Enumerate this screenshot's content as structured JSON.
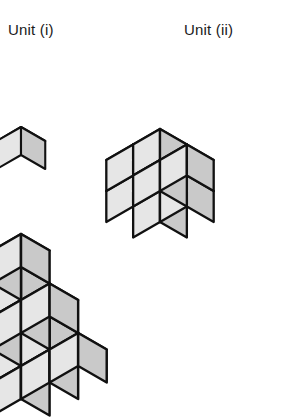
{
  "figure": {
    "title_unit_i": "Unit (i)",
    "title_unit_ii": "Unit (ii)"
  },
  "colors": {
    "top_face": "#ededed",
    "left_face": "#e6e6e6",
    "right_face": "#c9c9c9",
    "outline": "#111111",
    "background": "#ffffff",
    "text": "#1a1a1a"
  },
  "geometry": {
    "unit_i": {
      "cubes": 1,
      "cube_size_px": 28,
      "origin_x": 21,
      "origin_y": 155,
      "cells": [
        [
          0,
          0,
          0
        ]
      ]
    },
    "unit_ii": {
      "cubes": 8,
      "cube_size_px": 31,
      "origin_x": 160,
      "origin_y": 191,
      "dimensions": "2 x 2 x 2",
      "cells": [
        [
          0,
          0,
          0
        ],
        [
          1,
          0,
          0
        ],
        [
          0,
          1,
          0
        ],
        [
          1,
          1,
          0
        ],
        [
          0,
          0,
          1
        ],
        [
          1,
          0,
          1
        ],
        [
          0,
          1,
          1
        ],
        [
          1,
          1,
          1
        ]
      ]
    },
    "composite": {
      "cubes": 14,
      "cube_size_px": 33,
      "origin_x": 21,
      "origin_y": 333,
      "description": "three-step staircase, 3 deep",
      "heights": [
        3,
        2,
        1
      ],
      "cells": [
        [
          0,
          0,
          0
        ],
        [
          0,
          1,
          0
        ],
        [
          0,
          2,
          0
        ],
        [
          1,
          0,
          0
        ],
        [
          1,
          1,
          0
        ],
        [
          1,
          2,
          0
        ],
        [
          2,
          0,
          0
        ],
        [
          2,
          1,
          0
        ],
        [
          2,
          2,
          0
        ],
        [
          0,
          0,
          1
        ],
        [
          0,
          1,
          1
        ],
        [
          0,
          2,
          1
        ],
        [
          1,
          0,
          1
        ],
        [
          1,
          1,
          1
        ],
        [
          1,
          2,
          1
        ],
        [
          0,
          0,
          2
        ],
        [
          0,
          1,
          2
        ],
        [
          0,
          2,
          2
        ]
      ]
    }
  }
}
